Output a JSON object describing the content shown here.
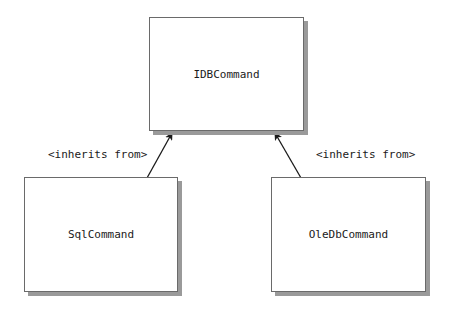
{
  "diagram": {
    "type": "class-inheritance",
    "nodes": [
      {
        "id": "idbcommand",
        "label": "IDBCommand",
        "role": "interface"
      },
      {
        "id": "sqlcommand",
        "label": "SqlCommand",
        "role": "implementation"
      },
      {
        "id": "oledbcommand",
        "label": "OleDbCommand",
        "role": "implementation"
      }
    ],
    "edges": [
      {
        "from": "sqlcommand",
        "to": "idbcommand",
        "label": "<inherits from>"
      },
      {
        "from": "oledbcommand",
        "to": "idbcommand",
        "label": "<inherits from>"
      }
    ]
  },
  "colors": {
    "border": "#6a6a6a",
    "shadow": "#9a9a9a",
    "arrow": "#1a1a1a",
    "text": "#1a1a1a",
    "background": "#ffffff"
  }
}
